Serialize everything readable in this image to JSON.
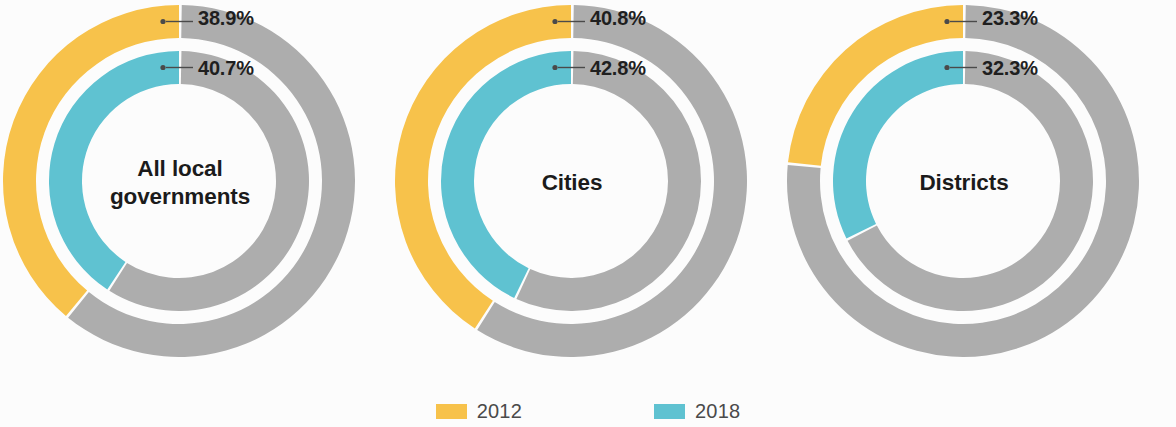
{
  "colors": {
    "series_2012": "#f7c24b",
    "series_2018": "#5fc2d1",
    "remainder": "#adadad",
    "background": "#fcfcfc",
    "label_text": "#1f1f1f",
    "legend_text": "#4a4a4a",
    "leader_line": "#4a4a4a"
  },
  "legend": {
    "items": [
      {
        "label": "2012",
        "color": "#f7c24b",
        "swatch_name": "legend-swatch-2012"
      },
      {
        "label": "2018",
        "color": "#5fc2d1",
        "swatch_name": "legend-swatch-2018"
      }
    ]
  },
  "charts": [
    {
      "center_label": "All local\ngovernments",
      "outer_value_label": "38.9%",
      "inner_value_label": "40.7%"
    },
    {
      "center_label": "Cities",
      "outer_value_label": "40.8%",
      "inner_value_label": "42.8%"
    },
    {
      "center_label": "Districts",
      "outer_value_label": "23.3%",
      "inner_value_label": "32.3%"
    }
  ],
  "chart_data": {
    "type": "pie",
    "title": "",
    "subtitle": "",
    "variant": "nested-donut",
    "legend_position": "bottom-center",
    "grid": false,
    "unit": "percent",
    "series": [
      {
        "name": "2012",
        "ring": "outer",
        "color": "#f7c24b",
        "values": [
          38.9,
          40.8,
          23.3
        ]
      },
      {
        "name": "2018",
        "ring": "inner",
        "color": "#5fc2d1",
        "values": [
          40.7,
          42.8,
          32.3
        ]
      }
    ],
    "categories": [
      "All local governments",
      "Cities",
      "Districts"
    ],
    "remainder_color": "#adadad",
    "remainder_values": {
      "2012": [
        61.1,
        59.2,
        76.7
      ],
      "2018": [
        59.3,
        57.2,
        67.7
      ]
    },
    "panels": [
      {
        "label": "All local governments",
        "slices": [
          {
            "name": "2012",
            "value": 38.9,
            "label": "38.9%",
            "ring": "outer",
            "color": "#f7c24b"
          },
          {
            "name": "2012 remainder",
            "value": 61.1,
            "ring": "outer",
            "color": "#adadad"
          },
          {
            "name": "2018",
            "value": 40.7,
            "label": "40.7%",
            "ring": "inner",
            "color": "#5fc2d1"
          },
          {
            "name": "2018 remainder",
            "value": 59.3,
            "ring": "inner",
            "color": "#adadad"
          }
        ]
      },
      {
        "label": "Cities",
        "slices": [
          {
            "name": "2012",
            "value": 40.8,
            "label": "40.8%",
            "ring": "outer",
            "color": "#f7c24b"
          },
          {
            "name": "2012 remainder",
            "value": 59.2,
            "ring": "outer",
            "color": "#adadad"
          },
          {
            "name": "2018",
            "value": 42.8,
            "label": "42.8%",
            "ring": "inner",
            "color": "#5fc2d1"
          },
          {
            "name": "2018 remainder",
            "value": 57.2,
            "ring": "inner",
            "color": "#adadad"
          }
        ]
      },
      {
        "label": "Districts",
        "slices": [
          {
            "name": "2012",
            "value": 23.3,
            "label": "23.3%",
            "ring": "outer",
            "color": "#f7c24b"
          },
          {
            "name": "2012 remainder",
            "value": 76.7,
            "ring": "outer",
            "color": "#adadad"
          },
          {
            "name": "2018",
            "value": 32.3,
            "label": "32.3%",
            "ring": "inner",
            "color": "#5fc2d1"
          },
          {
            "name": "2018 remainder",
            "value": 67.7,
            "ring": "inner",
            "color": "#adadad"
          }
        ]
      }
    ],
    "geometry": {
      "outer_ring_outer_radius": 176,
      "outer_ring_inner_radius": 143,
      "inner_ring_outer_radius": 130,
      "inner_ring_inner_radius": 97,
      "center_y": 181,
      "centers_x": [
        179,
        571,
        963
      ],
      "start_angle_deg": -90,
      "direction": "counterclockwise"
    }
  }
}
